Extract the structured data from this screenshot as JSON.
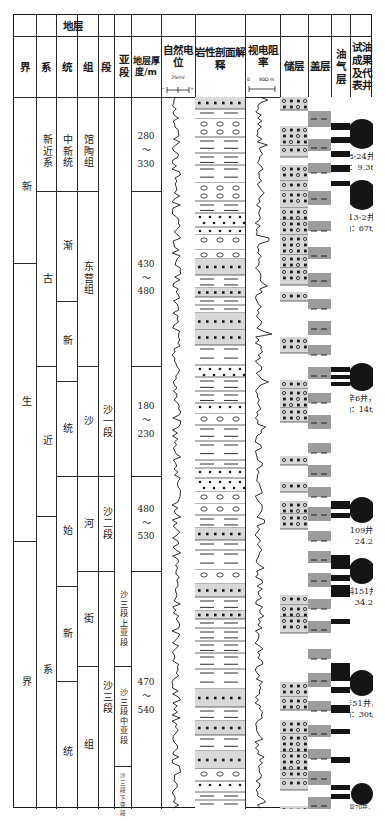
{
  "header": {
    "group_strata": "地层",
    "columns": [
      {
        "key": "jie",
        "label": "界"
      },
      {
        "key": "xi",
        "label": "系"
      },
      {
        "key": "tong",
        "label": "统"
      },
      {
        "key": "zu",
        "label": "组"
      },
      {
        "key": "duan",
        "label": "段"
      },
      {
        "key": "yaduan",
        "label": "亚段"
      },
      {
        "key": "thickness",
        "label": "地层厚度/m"
      },
      {
        "key": "sp",
        "label": "自然电位"
      },
      {
        "key": "litho",
        "label": "岩性剖面解释"
      },
      {
        "key": "res",
        "label": "视电阻率"
      },
      {
        "key": "reservoir",
        "label": "储层"
      },
      {
        "key": "seal",
        "label": "盖层"
      },
      {
        "key": "oilgas",
        "label": "油气层"
      },
      {
        "key": "test",
        "label": "试油成果及代表井"
      }
    ],
    "sp_scale": {
      "value": "25mV",
      "minus": "−",
      "plus": "+"
    },
    "res_scale": {
      "min": "0",
      "max": "80Ω·m"
    }
  },
  "strata": {
    "jie": [
      {
        "label": "新",
        "top": 96,
        "height": 152
      },
      {
        "label": "生",
        "top": 248,
        "height": 278
      },
      {
        "label": "界",
        "top": 526,
        "height": 282
      }
    ],
    "xi": [
      {
        "label": "新近系",
        "top": 96,
        "height": 80
      },
      {
        "label": "古",
        "top": 176,
        "height": 175
      },
      {
        "label": "近",
        "top": 351,
        "height": 150
      },
      {
        "label": "系",
        "top": 501,
        "height": 307
      }
    ],
    "tong": [
      {
        "label": "中新统",
        "top": 96,
        "height": 80
      },
      {
        "label": "渐",
        "top": 176,
        "height": 110
      },
      {
        "label": "新",
        "top": 286,
        "height": 80
      },
      {
        "label": "统",
        "top": 366,
        "height": 95
      },
      {
        "label": "始",
        "top": 461,
        "height": 110
      },
      {
        "label": "新",
        "top": 571,
        "height": 95
      },
      {
        "label": "统",
        "top": 666,
        "height": 142
      }
    ],
    "zu": [
      {
        "label": "馆陶组",
        "top": 96,
        "height": 80
      },
      {
        "label": "东营组",
        "top": 176,
        "height": 175
      },
      {
        "label": "沙",
        "top": 351,
        "height": 110
      },
      {
        "label": "河",
        "top": 461,
        "height": 95
      },
      {
        "label": "街",
        "top": 556,
        "height": 95
      },
      {
        "label": "组",
        "top": 651,
        "height": 157
      }
    ],
    "duan": [
      {
        "label": "沙一段",
        "top": 351,
        "height": 110
      },
      {
        "label": "沙二段",
        "top": 461,
        "height": 95
      },
      {
        "label": "沙三段",
        "top": 556,
        "height": 252
      }
    ],
    "yaduan": [
      {
        "label": "沙三段上亚段",
        "top": 556,
        "height": 95,
        "size": "sm"
      },
      {
        "label": "沙三段中亚段",
        "top": 651,
        "height": 100,
        "size": "sm"
      },
      {
        "label": "沙三段下亚段",
        "top": 751,
        "height": 57,
        "size": "xs"
      }
    ],
    "thickness": [
      {
        "value": "280\n～\n330",
        "top": 96,
        "height": 80
      },
      {
        "value": "430\n～\n480",
        "top": 176,
        "height": 175
      },
      {
        "value": "180\n～\n230",
        "top": 351,
        "height": 110
      },
      {
        "value": "480\n～\n530",
        "top": 461,
        "height": 95
      },
      {
        "value": "470\n～\n540",
        "top": 556,
        "height": 252
      }
    ]
  },
  "chart_data": {
    "type": "table",
    "depth_axis_top_m": 0,
    "units": [
      {
        "system": "新近系",
        "series": "中新统",
        "formation": "馆陶组",
        "member": "",
        "submember": "",
        "thickness_m": "280～330"
      },
      {
        "system": "古近系",
        "series": "渐新统",
        "formation": "东营组",
        "member": "",
        "submember": "",
        "thickness_m": "430～480"
      },
      {
        "system": "古近系",
        "series": "渐新统",
        "formation": "沙河街组",
        "member": "沙一段",
        "submember": "",
        "thickness_m": "180～230"
      },
      {
        "system": "古近系",
        "series": "渐新统",
        "formation": "沙河街组",
        "member": "沙二段",
        "submember": "",
        "thickness_m": "480～530"
      },
      {
        "system": "古近系",
        "series": "始新统",
        "formation": "沙河街组",
        "member": "沙三段",
        "submember": "沙三段上亚段",
        "thickness_m": "470～540"
      },
      {
        "system": "古近系",
        "series": "始新统",
        "formation": "沙河街组",
        "member": "沙三段",
        "submember": "沙三段中亚段",
        "thickness_m": "470～540"
      },
      {
        "system": "古近系",
        "series": "始新统",
        "formation": "沙河街组",
        "member": "沙三段",
        "submember": "沙三段下亚段",
        "thickness_m": "470～540"
      }
    ],
    "sp_curve_label": "自然电位",
    "res_curve_label": "视电阻率",
    "res_range": [
      0,
      80
    ],
    "res_unit": "Ω·m",
    "sp_scale_mV": 25
  },
  "wells": [
    {
      "name": "营8-24井，",
      "rate": "油：9.3t/d",
      "dot_top": 104,
      "dot_size": 30,
      "txt_top": 136
    },
    {
      "name": "营13-2井，",
      "rate": "油：67t/d",
      "dot_top": 165,
      "dot_size": 30,
      "txt_top": 197
    },
    {
      "name": "辛6井，",
      "rate": "油：14t/d",
      "dot_top": 348,
      "dot_size": 28,
      "txt_top": 378
    },
    {
      "name": "辛109井，",
      "rate": "油：24.2t/d",
      "dot_top": 482,
      "dot_size": 26,
      "txt_top": 510
    },
    {
      "name": "辛斜151井，",
      "rate": "油：34.2t/d",
      "dot_top": 543,
      "dot_size": 26,
      "txt_top": 571
    },
    {
      "name": "辛51井，",
      "rate": "油：30t/d",
      "dot_top": 655,
      "dot_size": 26,
      "txt_top": 683
    },
    {
      "name": "营70井，",
      "rate": "油：18.4t/d",
      "dot_top": 768,
      "dot_size": 22,
      "txt_top": 789,
      "small": true
    }
  ],
  "seal_bands": [
    {
      "top": 96,
      "height": 16
    },
    {
      "top": 124,
      "height": 12
    },
    {
      "top": 148,
      "height": 10
    },
    {
      "top": 176,
      "height": 14
    },
    {
      "top": 206,
      "height": 10
    },
    {
      "top": 232,
      "height": 12
    },
    {
      "top": 258,
      "height": 14
    },
    {
      "top": 284,
      "height": 10
    },
    {
      "top": 306,
      "height": 14
    },
    {
      "top": 330,
      "height": 10
    },
    {
      "top": 352,
      "height": 12
    },
    {
      "top": 378,
      "height": 10
    },
    {
      "top": 400,
      "height": 14
    },
    {
      "top": 428,
      "height": 10
    },
    {
      "top": 450,
      "height": 12
    },
    {
      "top": 472,
      "height": 10
    },
    {
      "top": 492,
      "height": 14
    },
    {
      "top": 516,
      "height": 10
    },
    {
      "top": 536,
      "height": 12
    },
    {
      "top": 558,
      "height": 14
    },
    {
      "top": 584,
      "height": 10
    },
    {
      "top": 606,
      "height": 12
    },
    {
      "top": 634,
      "height": 10
    },
    {
      "top": 658,
      "height": 14
    },
    {
      "top": 686,
      "height": 10
    },
    {
      "top": 710,
      "height": 12
    },
    {
      "top": 734,
      "height": 10
    },
    {
      "top": 756,
      "height": 14
    },
    {
      "top": 782,
      "height": 12
    }
  ],
  "oil_bands": [
    {
      "top": 108,
      "height": 7
    },
    {
      "top": 122,
      "height": 6
    },
    {
      "top": 136,
      "height": 6
    },
    {
      "top": 150,
      "height": 7
    },
    {
      "top": 166,
      "height": 5
    },
    {
      "top": 352,
      "height": 5
    },
    {
      "top": 360,
      "height": 4
    },
    {
      "top": 367,
      "height": 4
    },
    {
      "top": 486,
      "height": 8
    },
    {
      "top": 498,
      "height": 5
    },
    {
      "top": 540,
      "height": 14
    },
    {
      "top": 560,
      "height": 6
    },
    {
      "top": 570,
      "height": 12
    },
    {
      "top": 604,
      "height": 5
    },
    {
      "top": 648,
      "height": 18
    },
    {
      "top": 672,
      "height": 6
    },
    {
      "top": 690,
      "height": 8
    },
    {
      "top": 714,
      "height": 5
    },
    {
      "top": 742,
      "height": 6
    },
    {
      "top": 770,
      "height": 5
    },
    {
      "top": 779,
      "height": 5
    }
  ]
}
